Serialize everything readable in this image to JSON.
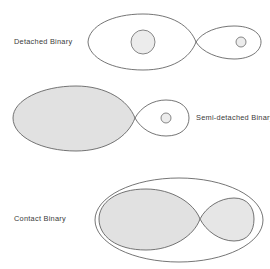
{
  "figure": {
    "title": "",
    "background_color": "#ffffff",
    "outline_color": "#5c5c5c",
    "fill_color": "#e1e1e1",
    "star_fill_color": "#ececec",
    "text_color": "#3a3a3a",
    "cropped_header_text": ""
  },
  "panels": [
    {
      "id": "detached",
      "label": "Detached Binary",
      "label_x": 14,
      "label_y": 42,
      "description": "Two stars well inside their Roche lobes; neither lobe is filled.",
      "primary": {
        "lobe_filled": false,
        "star_center_x": 143,
        "star_center_y": 42,
        "star_radius": 12
      },
      "secondary": {
        "lobe_filled": false,
        "star_center_x": 241,
        "star_center_y": 42,
        "star_radius": 5
      },
      "l1_x": 196,
      "l1_y": 42,
      "common_envelope": false
    },
    {
      "id": "semi-detached",
      "label": "Semi-detached Binary",
      "label_x": 181,
      "label_y": 118,
      "description": "The larger star exactly fills its Roche lobe; the companion does not.",
      "primary": {
        "lobe_filled": true,
        "star_center_x": 0,
        "star_center_y": 0,
        "star_radius": 0
      },
      "secondary": {
        "lobe_filled": false,
        "star_center_x": 166,
        "star_center_y": 118,
        "star_radius": 5
      },
      "l1_x": 135,
      "l1_y": 118,
      "common_envelope": false
    },
    {
      "id": "contact",
      "label": "Contact Binary",
      "label_x": 14,
      "label_y": 217,
      "description": "Both stars overflow their Roche lobes and share a common envelope.",
      "primary": {
        "lobe_filled": true,
        "star_center_x": 0,
        "star_center_y": 0,
        "star_radius": 0
      },
      "secondary": {
        "lobe_filled": true,
        "star_center_x": 0,
        "star_center_y": 0,
        "star_radius": 0
      },
      "l1_x": 200,
      "l1_y": 219,
      "common_envelope": true
    }
  ]
}
